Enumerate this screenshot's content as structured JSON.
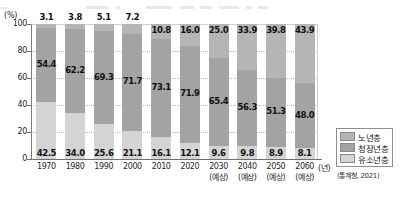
{
  "axis": {
    "y_unit": "(%)",
    "y_ticks": [
      "100",
      "80",
      "60",
      "40",
      "20",
      "0"
    ],
    "x_unit": "(년)"
  },
  "legend": {
    "items": [
      {
        "label": "노년층",
        "color": "#b5b5b5"
      },
      {
        "label": "청장년층",
        "color": "#a3a3a3"
      },
      {
        "label": "유소년층",
        "color": "#d4d4d4"
      }
    ]
  },
  "source": "(통계청, 2021)",
  "chart_data": {
    "type": "bar",
    "title": "",
    "xlabel": "(년)",
    "ylabel": "(%)",
    "ylim": [
      0,
      100
    ],
    "grid": true,
    "stacked": true,
    "legend_position": "right",
    "categories": [
      "1970",
      "1980",
      "1990",
      "2000",
      "2010",
      "2020",
      "2030",
      "2040",
      "2050",
      "2060"
    ],
    "category_notes": [
      "",
      "",
      "",
      "",
      "",
      "",
      "(예상)",
      "(예상)",
      "(예상)",
      "(예상)"
    ],
    "series": [
      {
        "name": "노년층",
        "color": "#b5b5b5",
        "values": [
          3.1,
          3.8,
          5.1,
          7.2,
          10.8,
          16.0,
          25.0,
          33.9,
          39.8,
          43.9
        ],
        "labels": [
          "3.1",
          "3.8",
          "5.1",
          "7.2",
          "10.8",
          "16.0",
          "25.0",
          "33.9",
          "39.8",
          "43.9"
        ]
      },
      {
        "name": "청장년층",
        "color": "#a3a3a3",
        "values": [
          54.4,
          62.2,
          69.3,
          71.7,
          73.1,
          71.9,
          65.4,
          56.3,
          51.3,
          48.0
        ],
        "labels": [
          "54.4",
          "62.2",
          "69.3",
          "71.7",
          "73.1",
          "71.9",
          "65.4",
          "56.3",
          "51.3",
          "48.0"
        ]
      },
      {
        "name": "유소년층",
        "color": "#d4d4d4",
        "values": [
          42.5,
          34.0,
          25.6,
          21.1,
          16.1,
          12.1,
          9.6,
          9.8,
          8.9,
          8.1
        ],
        "labels": [
          "42.5",
          "34.0",
          "25.6",
          "21.1",
          "16.1",
          "12.1",
          "9.6",
          "9.8",
          "8.9",
          "8.1"
        ]
      }
    ]
  }
}
